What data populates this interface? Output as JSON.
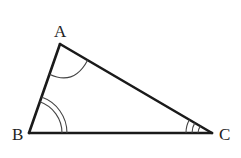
{
  "diagram": {
    "type": "triangle",
    "vertices": {
      "A": {
        "label": "A",
        "x": 60,
        "y": 44
      },
      "B": {
        "label": "B",
        "x": 29,
        "y": 133
      },
      "C": {
        "label": "C",
        "x": 212,
        "y": 133
      }
    },
    "angle_marks": {
      "A": {
        "arcs": 1
      },
      "B": {
        "arcs": 2
      },
      "C": {
        "arcs": 3
      }
    },
    "colors": {
      "stroke": "#1a1a1a",
      "background": "#ffffff"
    }
  }
}
